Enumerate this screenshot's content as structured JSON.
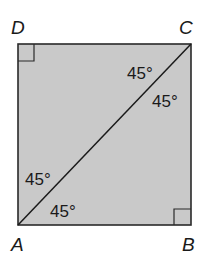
{
  "diagram": {
    "shape": "square",
    "fill_color": "#c9c9c9",
    "stroke_color": "#2a2a2a",
    "vertices": [
      {
        "name": "D",
        "position": "top-left"
      },
      {
        "name": "C",
        "position": "top-right"
      },
      {
        "name": "A",
        "position": "bottom-left"
      },
      {
        "name": "B",
        "position": "bottom-right"
      }
    ],
    "diagonal": "AC",
    "right_angle_markers": [
      "D",
      "B"
    ],
    "angles": [
      {
        "vertex": "C",
        "between": "DC-CA",
        "label": "45°"
      },
      {
        "vertex": "C",
        "between": "AC-CB",
        "label": "45°"
      },
      {
        "vertex": "A",
        "between": "DA-AC",
        "label": "45°"
      },
      {
        "vertex": "A",
        "between": "CA-AB",
        "label": "45°"
      }
    ]
  }
}
